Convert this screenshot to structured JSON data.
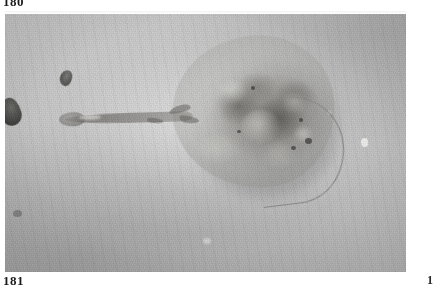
{
  "page": {
    "folio_top": "180",
    "folio_bottom": "181",
    "folio_right_partial": "1"
  },
  "photo": {
    "caption": "",
    "subject": "ray",
    "subject_description": "Dorsal view of a ray resting on sandy seafloor",
    "palette": {
      "substrate_light": "#cdcdcb",
      "substrate_mid": "#c2c2c0",
      "substrate_dark": "#bdbdbb",
      "ray_body": "#b0b0ac",
      "ray_core_dark": "#4a4844",
      "debris_dark": "#3a3a38",
      "highlight": "#f2f2f0",
      "page_background": "#ffffff",
      "text": "#1a1a1a"
    },
    "features": [
      "mottled-disc",
      "tail-extending-left",
      "dark-rock-left-edge",
      "white-speck-right",
      "sand-ripples"
    ]
  }
}
